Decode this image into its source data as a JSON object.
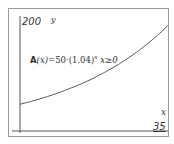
{
  "chart_data": {
    "type": "line",
    "title": "",
    "xlabel": "x",
    "ylabel": "y",
    "xlim": [
      0,
      35
    ],
    "ylim": [
      0,
      200
    ],
    "tick_labels": {
      "x_max": "35",
      "y_max": "200"
    },
    "grid": false,
    "annotation": "A(x)=50·(1.04)^x  x≥0",
    "series": [
      {
        "name": "A(x)=50·(1.04)^x",
        "x": [
          0,
          5,
          10,
          15,
          20,
          25,
          30,
          35
        ],
        "y": [
          50,
          60.8,
          74.0,
          90.0,
          109.6,
          133.3,
          162.2,
          197.3
        ]
      }
    ]
  },
  "labels": {
    "y_max": "200",
    "y_axis": "y",
    "x_axis": "x",
    "x_max": "35",
    "eq_func": "A",
    "eq_arg": "(x)",
    "eq_body": "=50·(1.04)",
    "eq_exp": "x",
    "eq_domain": " x≥0"
  }
}
